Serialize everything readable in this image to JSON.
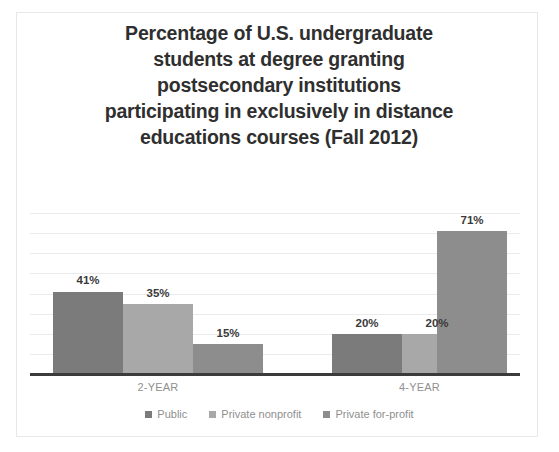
{
  "chart_data": {
    "type": "bar",
    "title": "Percentage of U.S. undergraduate students at degree granting postsecondary institutions participating in exclusively in distance educations courses (Fall 2012)",
    "title_lines": [
      "Percentage of U.S. undergraduate",
      "students at degree granting",
      "postsecondary institutions",
      "participating in exclusively in distance",
      "educations courses (Fall 2012)"
    ],
    "categories": [
      "2-YEAR",
      "4-YEAR"
    ],
    "series": [
      {
        "name": "Public",
        "values": [
          41,
          35
        ],
        "color": "#7b7b7b"
      },
      {
        "name": "Private nonprofit",
        "values": [
          35,
          20
        ],
        "color": "#a8a8a8"
      },
      {
        "name": "Private for-profit",
        "values": [
          15,
          71
        ],
        "color": "#8d8d8d"
      }
    ],
    "bars": [
      {
        "group": "2-YEAR",
        "series": "Public",
        "value": 41,
        "label": "41%",
        "color": "#7b7b7b"
      },
      {
        "group": "2-YEAR",
        "series": "Private nonprofit",
        "value": 35,
        "label": "35%",
        "color": "#a8a8a8"
      },
      {
        "group": "2-YEAR",
        "series": "Private for-profit",
        "value": 15,
        "label": "15%",
        "color": "#8d8d8d"
      },
      {
        "group": "4-YEAR",
        "series": "Public",
        "value": 20,
        "label": "20%",
        "color": "#7b7b7b"
      },
      {
        "group": "4-YEAR",
        "series": "Private nonprofit",
        "value": 20,
        "label": "20%",
        "color": "#a8a8a8"
      },
      {
        "group": "4-YEAR",
        "series": "Private for-profit",
        "value": 71,
        "label": "71%",
        "color": "#8d8d8d"
      }
    ],
    "xlabel": "",
    "ylabel": "",
    "ylim": [
      0,
      80
    ],
    "gridlines": [
      10,
      20,
      30,
      40,
      50,
      60,
      70,
      80
    ],
    "grid": true,
    "legend_position": "bottom",
    "legend": [
      "Public",
      "Private nonprofit",
      "Private for-profit"
    ],
    "colors": {
      "public": "#7b7b7b",
      "private_nonprofit": "#a8a8a8",
      "private_for_profit": "#8d8d8d",
      "title": "#2f2f2f",
      "gridline": "#ebebeb",
      "axis": "#3b3b3b",
      "tick_label": "#8f8f8f",
      "background": "#ffffff",
      "frame": "#e8e8e8"
    }
  }
}
